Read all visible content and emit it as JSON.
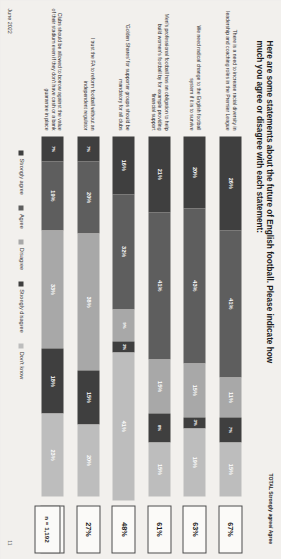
{
  "slide": {
    "title": "Here are some statements about the future of English football.\nPlease indicate how much you agree or disagree with each statement:",
    "total_header": "TOTAL Strongly agree/ Agree",
    "sample_label": "n = 1,192",
    "date": "June 2022",
    "page_number": "11"
  },
  "colors": {
    "strongly_agree": "#3f3f3f",
    "agree": "#5e5e5e",
    "disagree": "#a8a8a8",
    "strongly_disagree": "#3f3f3f",
    "dont_know": "#bdbdbd",
    "box_border": "#4a4a4a",
    "background": "#f2f0ed"
  },
  "legend": [
    {
      "label": "Strongly agree",
      "color": "#3f3f3f"
    },
    {
      "label": "Agree",
      "color": "#5e5e5e"
    },
    {
      "label": "Disagree",
      "color": "#a8a8a8"
    },
    {
      "label": "Strongly disagree",
      "color": "#3f3f3f"
    },
    {
      "label": "Don't know",
      "color": "#bdbdbd"
    }
  ],
  "chart_data": {
    "type": "bar",
    "title": "Here are some statements about the future of English football. Please indicate how much you agree or disagree with each statement:",
    "xlabel": "",
    "ylabel": "",
    "xlim": [
      0,
      100
    ],
    "grid": false,
    "legend_position": "bottom",
    "stacked": true,
    "orientation": "horizontal",
    "categories": [
      "There is a need to increase racial diversity in leadership and coaching roles in the Premier League",
      "We need radical change to the English football system if it is to survive",
      "Men's professional football has an obligation to help build women's football by for example providing financial support",
      "'Golden Shares' for supporter groups should be mandatory for all clubs",
      "I trust the FA to reform football without an independent regulator",
      "Clubs should be allowed to borrow against the value of their stadium even if they don't have cash or a bank guarantee in place"
    ],
    "series": [
      {
        "name": "Strongly agree",
        "values": [
          26,
          20,
          21,
          16,
          7,
          7
        ]
      },
      {
        "name": "Agree",
        "values": [
          41,
          43,
          41,
          32,
          20,
          19
        ]
      },
      {
        "name": "Disagree",
        "values": [
          11,
          15,
          15,
          9,
          38,
          33
        ]
      },
      {
        "name": "Strongly disagree",
        "values": [
          7,
          3,
          8,
          3,
          15,
          18
        ]
      },
      {
        "name": "Don't know",
        "values": [
          15,
          19,
          15,
          41,
          20,
          23
        ]
      }
    ],
    "totals_label": "TOTAL Strongly agree/ Agree",
    "totals": [
      "67%",
      "63%",
      "61%",
      "48%",
      "27%",
      "26%"
    ],
    "sample_size": "n = 1,192"
  },
  "rows": [
    {
      "label": "There is a need to increase racial diversity in leadership and coaching roles in the Premier League",
      "total": "67%",
      "segments": [
        {
          "name": "Strongly agree",
          "value": 26,
          "text": "26%",
          "color": "#3f3f3f"
        },
        {
          "name": "Agree",
          "value": 41,
          "text": "41%",
          "color": "#5e5e5e"
        },
        {
          "name": "Disagree",
          "value": 11,
          "text": "11%",
          "color": "#a8a8a8"
        },
        {
          "name": "Strongly disagree",
          "value": 7,
          "text": "7%",
          "color": "#3f3f3f"
        },
        {
          "name": "Don't know",
          "value": 15,
          "text": "15%",
          "color": "#bdbdbd"
        }
      ]
    },
    {
      "label": "We need radical change to the English football system if it is to survive",
      "total": "63%",
      "segments": [
        {
          "name": "Strongly agree",
          "value": 20,
          "text": "20%",
          "color": "#3f3f3f"
        },
        {
          "name": "Agree",
          "value": 43,
          "text": "43%",
          "color": "#5e5e5e"
        },
        {
          "name": "Disagree",
          "value": 15,
          "text": "15%",
          "color": "#a8a8a8"
        },
        {
          "name": "Strongly disagree",
          "value": 3,
          "text": "3%",
          "color": "#3f3f3f"
        },
        {
          "name": "Don't know",
          "value": 19,
          "text": "19%",
          "color": "#bdbdbd"
        }
      ]
    },
    {
      "label": "Men's professional football has an obligation to help build women's football by for example providing financial support",
      "total": "61%",
      "segments": [
        {
          "name": "Strongly agree",
          "value": 21,
          "text": "21%",
          "color": "#3f3f3f"
        },
        {
          "name": "Agree",
          "value": 41,
          "text": "41%",
          "color": "#5e5e5e"
        },
        {
          "name": "Disagree",
          "value": 15,
          "text": "15%",
          "color": "#a8a8a8"
        },
        {
          "name": "Strongly disagree",
          "value": 8,
          "text": "8%",
          "color": "#3f3f3f"
        },
        {
          "name": "Don't know",
          "value": 15,
          "text": "15%",
          "color": "#bdbdbd"
        }
      ]
    },
    {
      "label": "'Golden Shares' for supporter groups should be mandatory for all clubs",
      "total": "48%",
      "segments": [
        {
          "name": "Strongly agree",
          "value": 16,
          "text": "16%",
          "color": "#3f3f3f"
        },
        {
          "name": "Agree",
          "value": 32,
          "text": "32%",
          "color": "#5e5e5e"
        },
        {
          "name": "Disagree",
          "value": 9,
          "text": "9%",
          "color": "#a8a8a8"
        },
        {
          "name": "Strongly disagree",
          "value": 3,
          "text": "3%",
          "color": "#3f3f3f"
        },
        {
          "name": "Don't know",
          "value": 41,
          "text": "41%",
          "color": "#bdbdbd"
        }
      ]
    },
    {
      "label": "I trust the FA to reform football without an independent regulator",
      "total": "27%",
      "segments": [
        {
          "name": "Strongly agree",
          "value": 7,
          "text": "7%",
          "color": "#3f3f3f"
        },
        {
          "name": "Agree",
          "value": 20,
          "text": "20%",
          "color": "#5e5e5e"
        },
        {
          "name": "Disagree",
          "value": 38,
          "text": "38%",
          "color": "#a8a8a8"
        },
        {
          "name": "Strongly disagree",
          "value": 15,
          "text": "15%",
          "color": "#3f3f3f"
        },
        {
          "name": "Don't know",
          "value": 20,
          "text": "20%",
          "color": "#bdbdbd"
        }
      ]
    },
    {
      "label": "Clubs should be allowed to borrow against the value of their stadium even if they don't have cash or a bank guarantee in place",
      "total": "26%",
      "segments": [
        {
          "name": "Strongly agree",
          "value": 7,
          "text": "7%",
          "color": "#3f3f3f"
        },
        {
          "name": "Agree",
          "value": 19,
          "text": "19%",
          "color": "#5e5e5e"
        },
        {
          "name": "Disagree",
          "value": 33,
          "text": "33%",
          "color": "#a8a8a8"
        },
        {
          "name": "Strongly disagree",
          "value": 18,
          "text": "18%",
          "color": "#3f3f3f"
        },
        {
          "name": "Don't know",
          "value": 23,
          "text": "23%",
          "color": "#bdbdbd"
        }
      ]
    }
  ]
}
